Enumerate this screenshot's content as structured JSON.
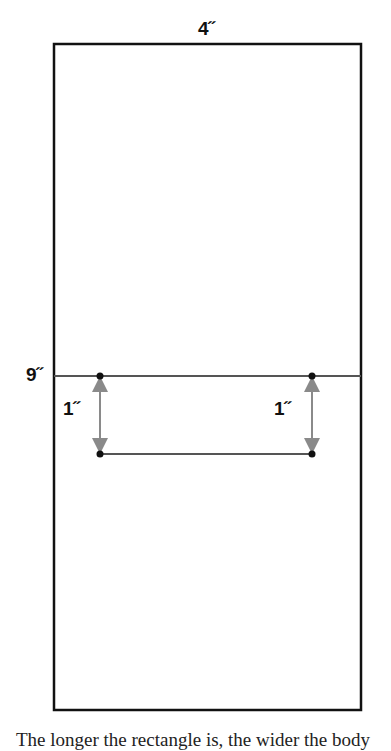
{
  "diagram": {
    "labels": {
      "width": "4˝",
      "height_mark": "9˝",
      "left_offset": "1˝",
      "right_offset": "1˝"
    },
    "colors": {
      "outline": "#111111",
      "arrow": "#8a8a8a",
      "fold_line": "#555555"
    }
  },
  "caption": "The longer the rectangle is, the wider the body"
}
